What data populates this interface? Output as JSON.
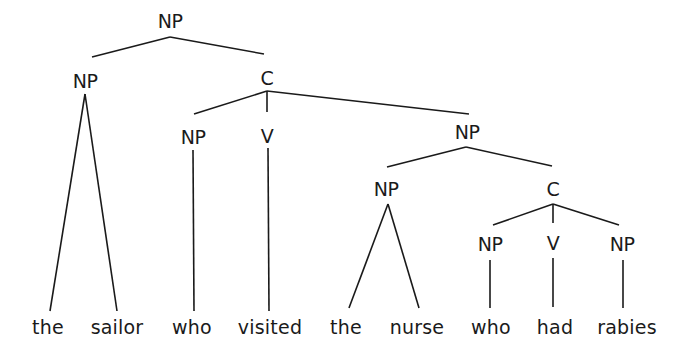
{
  "diagram": {
    "type": "syntax-tree",
    "sentence": "the sailor who visited the nurse who had rabies",
    "nodes": [
      {
        "id": "np_root",
        "label": "NP",
        "x": 170,
        "y": 12
      },
      {
        "id": "np_subj",
        "label": "NP",
        "x": 85,
        "y": 72
      },
      {
        "id": "c_rel1",
        "label": "C",
        "x": 267,
        "y": 69
      },
      {
        "id": "np_who1",
        "label": "NP",
        "x": 193,
        "y": 128
      },
      {
        "id": "v_visited",
        "label": "V",
        "x": 267,
        "y": 127
      },
      {
        "id": "np_obj",
        "label": "NP",
        "x": 467,
        "y": 123
      },
      {
        "id": "np_nurse",
        "label": "NP",
        "x": 386,
        "y": 180
      },
      {
        "id": "c_rel2",
        "label": "C",
        "x": 553,
        "y": 180
      },
      {
        "id": "np_who2",
        "label": "NP",
        "x": 490,
        "y": 235
      },
      {
        "id": "v_had",
        "label": "V",
        "x": 553,
        "y": 234
      },
      {
        "id": "np_rabies",
        "label": "NP",
        "x": 622,
        "y": 235
      }
    ],
    "words": [
      {
        "id": "w_the1",
        "text": "the",
        "x": 48,
        "y": 318
      },
      {
        "id": "w_sailor",
        "text": "sailor",
        "x": 117,
        "y": 318
      },
      {
        "id": "w_who1",
        "text": "who",
        "x": 192,
        "y": 318
      },
      {
        "id": "w_visited",
        "text": "visited",
        "x": 270,
        "y": 318
      },
      {
        "id": "w_the2",
        "text": "the",
        "x": 346,
        "y": 318
      },
      {
        "id": "w_nurse",
        "text": "nurse",
        "x": 417,
        "y": 318
      },
      {
        "id": "w_who2",
        "text": "who",
        "x": 491,
        "y": 318
      },
      {
        "id": "w_had",
        "text": "had",
        "x": 555,
        "y": 318
      },
      {
        "id": "w_rabies",
        "text": "rabies",
        "x": 627,
        "y": 318
      }
    ],
    "edges": [
      {
        "from": "np_root",
        "to": "np_subj",
        "x1": 170,
        "y1": 37,
        "x2": 92,
        "y2": 57
      },
      {
        "from": "np_root",
        "to": "c_rel1",
        "x1": 170,
        "y1": 37,
        "x2": 264,
        "y2": 54
      },
      {
        "from": "np_subj",
        "to": "w_the1",
        "x1": 85,
        "y1": 94,
        "x2": 50,
        "y2": 311
      },
      {
        "from": "np_subj",
        "to": "w_sailor",
        "x1": 85,
        "y1": 94,
        "x2": 117,
        "y2": 311
      },
      {
        "from": "c_rel1",
        "to": "np_who1",
        "x1": 267,
        "y1": 91,
        "x2": 194,
        "y2": 114
      },
      {
        "from": "c_rel1",
        "to": "v_visited",
        "x1": 267,
        "y1": 91,
        "x2": 267,
        "y2": 112
      },
      {
        "from": "c_rel1",
        "to": "np_obj",
        "x1": 267,
        "y1": 91,
        "x2": 469,
        "y2": 114
      },
      {
        "from": "np_who1",
        "to": "w_who1",
        "x1": 193,
        "y1": 150,
        "x2": 194,
        "y2": 311
      },
      {
        "from": "v_visited",
        "to": "w_visited",
        "x1": 268,
        "y1": 148,
        "x2": 269,
        "y2": 311
      },
      {
        "from": "np_obj",
        "to": "np_nurse",
        "x1": 466,
        "y1": 147,
        "x2": 387,
        "y2": 167
      },
      {
        "from": "np_obj",
        "to": "c_rel2",
        "x1": 466,
        "y1": 147,
        "x2": 552,
        "y2": 166
      },
      {
        "from": "np_nurse",
        "to": "w_the2",
        "x1": 388,
        "y1": 204,
        "x2": 349,
        "y2": 308
      },
      {
        "from": "np_nurse",
        "to": "w_nurse",
        "x1": 388,
        "y1": 204,
        "x2": 419,
        "y2": 308
      },
      {
        "from": "c_rel2",
        "to": "np_who2",
        "x1": 553,
        "y1": 204,
        "x2": 493,
        "y2": 225
      },
      {
        "from": "c_rel2",
        "to": "v_had",
        "x1": 553,
        "y1": 204,
        "x2": 553,
        "y2": 223
      },
      {
        "from": "c_rel2",
        "to": "np_rabies",
        "x1": 553,
        "y1": 204,
        "x2": 619,
        "y2": 225
      },
      {
        "from": "np_who2",
        "to": "w_who2",
        "x1": 490,
        "y1": 260,
        "x2": 490,
        "y2": 308
      },
      {
        "from": "v_had",
        "to": "w_had",
        "x1": 553,
        "y1": 258,
        "x2": 553,
        "y2": 307
      },
      {
        "from": "np_rabies",
        "to": "w_rabies",
        "x1": 623,
        "y1": 260,
        "x2": 623,
        "y2": 308
      }
    ]
  }
}
